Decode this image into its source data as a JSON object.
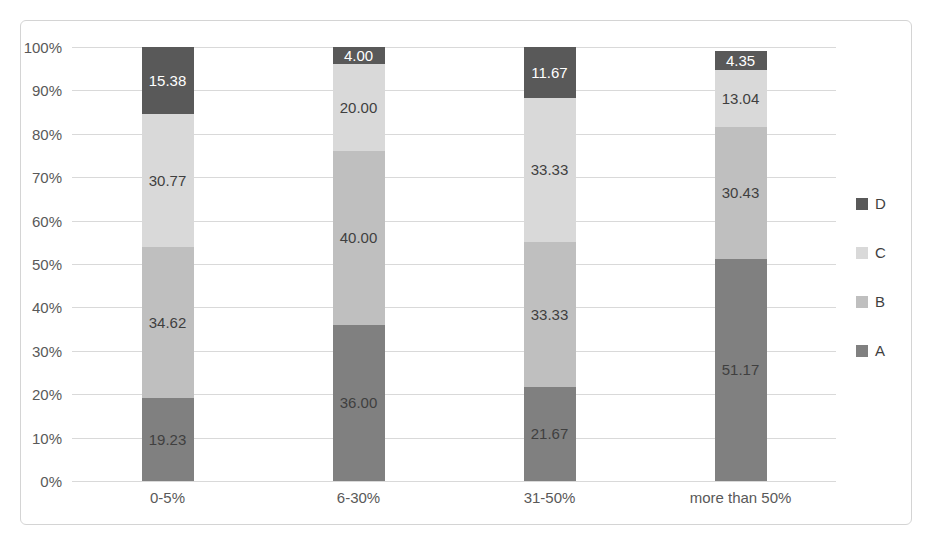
{
  "chart_data": {
    "type": "bar",
    "subtype": "stacked-100-percent",
    "title": "",
    "xlabel": "",
    "ylabel": "",
    "categories": [
      "0-5%",
      "6-30%",
      "31-50%",
      "more than 50%"
    ],
    "series": [
      {
        "name": "A",
        "color": "#808080",
        "values": [
          19.23,
          36.0,
          21.67,
          51.17
        ],
        "labels": [
          "19.23",
          "36.00",
          "21.67",
          "51.17"
        ]
      },
      {
        "name": "B",
        "color": "#bfbfbf",
        "values": [
          34.62,
          40.0,
          33.33,
          30.43
        ],
        "labels": [
          "34.62",
          "40.00",
          "33.33",
          "30.43"
        ]
      },
      {
        "name": "C",
        "color": "#d9d9d9",
        "values": [
          30.77,
          20.0,
          33.33,
          13.04
        ],
        "labels": [
          "30.77",
          "20.00",
          "33.33",
          "13.04"
        ]
      },
      {
        "name": "D",
        "color": "#595959",
        "values": [
          15.38,
          4.0,
          11.67,
          4.35
        ],
        "labels": [
          "15.38",
          "4.00",
          "11.67",
          "4.35"
        ]
      }
    ],
    "ylim": [
      0,
      100
    ],
    "yticks": [
      "0%",
      "10%",
      "20%",
      "30%",
      "40%",
      "50%",
      "60%",
      "70%",
      "80%",
      "90%",
      "100%"
    ],
    "ytick_values": [
      0,
      10,
      20,
      30,
      40,
      50,
      60,
      70,
      80,
      90,
      100
    ],
    "grid": true,
    "legend_position": "right",
    "legend_order": [
      "D",
      "C",
      "B",
      "A"
    ],
    "colors": {
      "A": "#808080",
      "B": "#bfbfbf",
      "C": "#d9d9d9",
      "D": "#595959",
      "gridline": "#d9d9d9",
      "axis_text": "#595959",
      "label_text": "#3f3f3f",
      "label_text_on_dark": "#ffffff",
      "background": "#ffffff",
      "frame_border": "#d4d4d4"
    }
  }
}
